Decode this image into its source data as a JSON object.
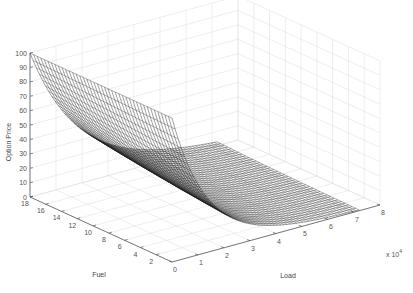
{
  "chart_data": {
    "type": "surface3d",
    "title": "",
    "xlabel": "Load",
    "ylabel": "Fuel",
    "zlabel": "Option Price",
    "x_multiplier": "× 10^4",
    "x_ticks": [
      "0",
      "1",
      "2",
      "3",
      "4",
      "5",
      "6",
      "7",
      "8"
    ],
    "y_ticks": [
      "2",
      "4",
      "6",
      "8",
      "10",
      "12",
      "14",
      "16",
      "18"
    ],
    "z_ticks": [
      "0",
      "10",
      "20",
      "30",
      "40",
      "50",
      "60",
      "70",
      "80",
      "90",
      "100"
    ],
    "xlim": [
      0,
      80000
    ],
    "ylim": [
      0,
      18
    ],
    "zlim": [
      0,
      100
    ],
    "grid": true,
    "colormap": "grayscale mesh (black edges on white)",
    "sample_points": [
      {
        "load": 0,
        "fuel": 18,
        "price": 100
      },
      {
        "load": 0,
        "fuel": 2,
        "price": 100
      },
      {
        "load": 10000,
        "fuel": 10,
        "price": 60
      },
      {
        "load": 20000,
        "fuel": 10,
        "price": 30
      },
      {
        "load": 30000,
        "fuel": 10,
        "price": 12
      },
      {
        "load": 40000,
        "fuel": 10,
        "price": 4
      },
      {
        "load": 50000,
        "fuel": 10,
        "price": 1
      },
      {
        "load": 70000,
        "fuel": 10,
        "price": 0
      }
    ]
  },
  "axes": {
    "zlabel": "Option Price",
    "ylabel": "Fuel",
    "xlabel": "Load",
    "multiplier_base": "x 10",
    "multiplier_exp": "4"
  }
}
